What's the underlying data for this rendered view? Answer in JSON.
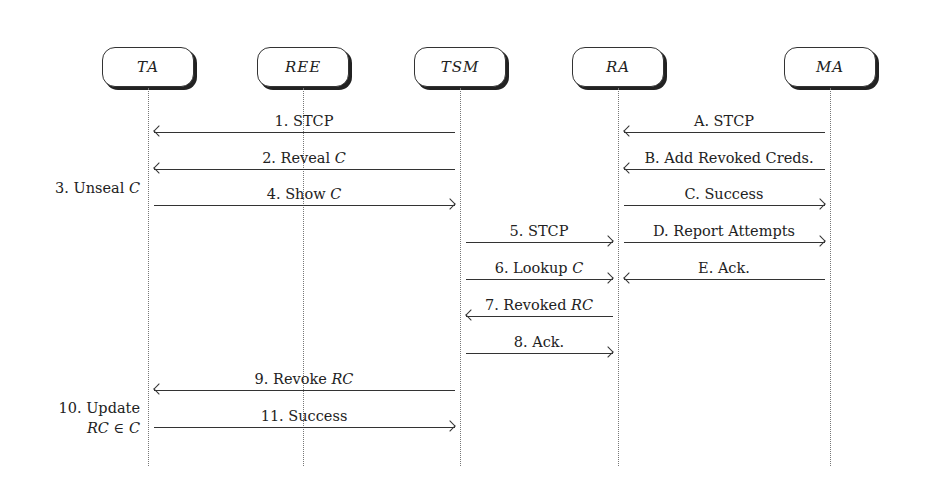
{
  "actors": [
    {
      "id": "TA",
      "label": "TA",
      "x": 148
    },
    {
      "id": "REE",
      "label": "REE",
      "x": 303
    },
    {
      "id": "TSM",
      "label": "TSM",
      "x": 460
    },
    {
      "id": "RA",
      "label": "RA",
      "x": 618
    },
    {
      "id": "MA",
      "label": "MA",
      "x": 830
    }
  ],
  "messages": [
    {
      "label": "1. STCP",
      "from": "TSM",
      "to": "TA",
      "y": 133
    },
    {
      "label": "2. Reveal C",
      "from": "TSM",
      "to": "TA",
      "y": 170
    },
    {
      "label": "4. Show C",
      "from": "TA",
      "to": "TSM",
      "y": 206
    },
    {
      "label": "5. STCP",
      "from": "TSM",
      "to": "RA",
      "y": 243
    },
    {
      "label": "6. Lookup C",
      "from": "TSM",
      "to": "RA",
      "y": 280
    },
    {
      "label": "7. Revoked RC",
      "from": "RA",
      "to": "TSM",
      "y": 317
    },
    {
      "label": "8. Ack.",
      "from": "TSM",
      "to": "RA",
      "y": 354
    },
    {
      "label": "9. Revoke RC",
      "from": "TSM",
      "to": "TA",
      "y": 391
    },
    {
      "label": "11. Success",
      "from": "TA",
      "to": "TSM",
      "y": 428
    },
    {
      "label": "A. STCP",
      "from": "MA",
      "to": "RA",
      "y": 133
    },
    {
      "label": "B. Add Revoked Creds.",
      "from": "MA",
      "to": "RA",
      "y": 170
    },
    {
      "label": "C. Success",
      "from": "RA",
      "to": "MA",
      "y": 206
    },
    {
      "label": "D. Report Attempts",
      "from": "RA",
      "to": "MA",
      "y": 243
    },
    {
      "label": "E. Ack.",
      "from": "MA",
      "to": "RA",
      "y": 280
    }
  ],
  "side_notes": [
    {
      "label": "3. Unseal C",
      "y": 178
    },
    {
      "label": "10. Update",
      "label2": "RC ∈ C",
      "y": 398
    }
  ]
}
